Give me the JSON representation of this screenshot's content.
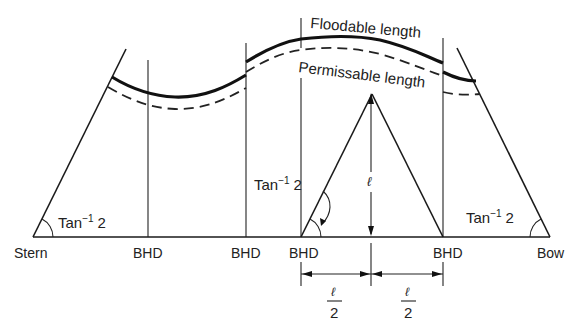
{
  "diagram": {
    "curves": {
      "floodable_label": "Floodable length",
      "permissible_label": "Permissable length"
    },
    "baseline_labels": {
      "stern": "Stern",
      "bow": "Bow",
      "bulkheads": [
        "BHD",
        "BHD",
        "BHD",
        "BHD"
      ]
    },
    "angle_labels": {
      "stern": "Tan",
      "bow": "Tan",
      "triangle": "Tan",
      "superscript": "−1",
      "value": "2"
    },
    "triangle": {
      "height_label": "ℓ",
      "half_left_num": "ℓ",
      "half_left_den": "2",
      "half_right_num": "ℓ",
      "half_right_den": "2"
    },
    "colors": {
      "line": "#1a1a1a",
      "background": "#ffffff"
    }
  }
}
